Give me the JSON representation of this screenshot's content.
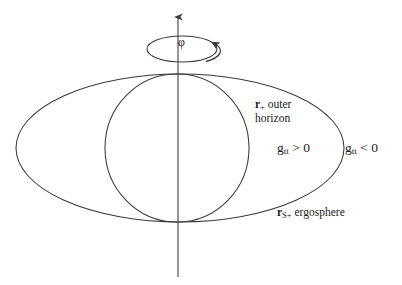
{
  "figure": {
    "background_color": "#ffffff",
    "stroke_color": "#3a3a3a",
    "text_color": "#1a1a1a",
    "width": 402,
    "height": 285
  },
  "axis": {
    "name": "rotation-axis",
    "description": "vertical arrow pointing up, axis of rotation",
    "x": 178,
    "y_top": 13,
    "y_bottom": 277
  },
  "rotation_indicator": {
    "label": "φ",
    "label_name": "phi-angle-label",
    "ellipse": {
      "cx": 182,
      "cy": 49,
      "rx": 35,
      "ry": 13
    },
    "arrow_direction": "counterclockwise-viewed-from-above"
  },
  "curves": [
    {
      "name": "ergosphere-ellipse",
      "shape": "ellipse",
      "cx": 180,
      "cy": 148,
      "rx": 164,
      "ry": 74
    },
    {
      "name": "outer-horizon-circle",
      "shape": "circle",
      "cx": 177,
      "cy": 148,
      "rx": 72,
      "ry": 74
    }
  ],
  "labels": {
    "outer_horizon": {
      "r_symbol": "r",
      "subscript": "+",
      "line1_rest": " outer",
      "line2": "horizon",
      "full_text": "r+ outer horizon"
    },
    "ergosphere": {
      "r_symbol": "r",
      "subscript": "S+",
      "rest": " ergosphere",
      "full_text": "rS+ ergosphere"
    },
    "gtt_inside": {
      "g_symbol": "g",
      "subscript": "tt",
      "relation": " > 0",
      "full_text": "gtt > 0"
    },
    "gtt_outside": {
      "g_symbol": "g",
      "subscript": "tt",
      "relation": " < 0",
      "full_text": "gtt < 0"
    }
  }
}
